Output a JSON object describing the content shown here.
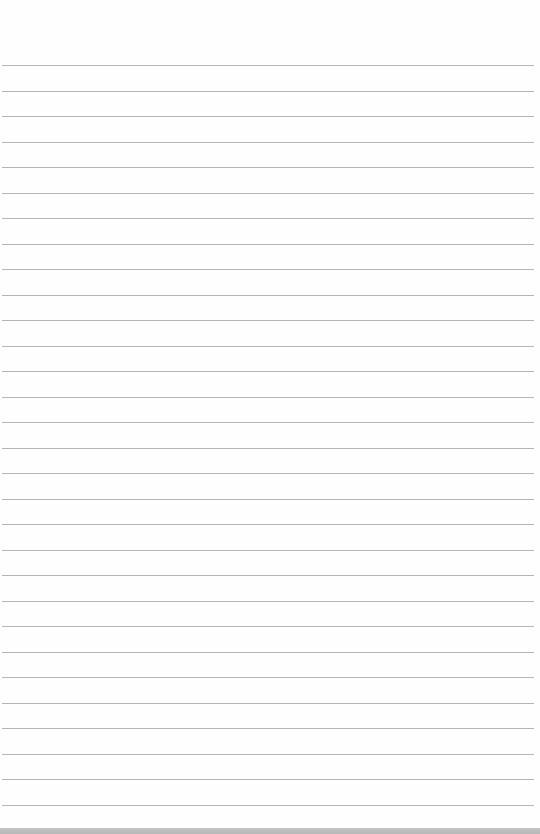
{
  "page": {
    "type": "blank ruled notebook paper",
    "line_count": 30,
    "first_line_y": 65,
    "line_spacing": 25.5,
    "line_color": "#a8a8a8",
    "paper_color": "#fefefe",
    "text": ""
  }
}
